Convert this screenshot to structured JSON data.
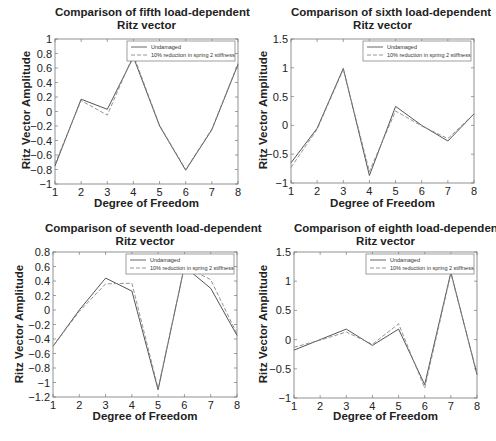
{
  "figure": {
    "legend": {
      "undamaged": "Undamaged",
      "damaged": "10% reduction in spring 2 stiffness"
    },
    "xlabel": "Degree of Freedom",
    "ylabel": "Ritz Vector Amplitude"
  },
  "colors": {
    "undamaged_line": "#555555",
    "damaged_line": "#888888",
    "axis": "#777777",
    "text": "#222222"
  },
  "chart_data": [
    {
      "type": "line",
      "title": "Comparison of fifth load-dependent Ritz vector",
      "title_lines": [
        "Comparison of fifth load-dependent",
        "Ritz vector"
      ],
      "xlabel": "Degree of Freedom",
      "ylabel": "Ritz Vector Amplitude",
      "x": [
        1,
        2,
        3,
        4,
        5,
        6,
        7,
        8
      ],
      "xlim": [
        1,
        8
      ],
      "ylim": [
        -1,
        1
      ],
      "yticks": [
        -1,
        -0.8,
        -0.6,
        -0.4,
        -0.2,
        0,
        0.2,
        0.4,
        0.6,
        0.8,
        1
      ],
      "ytick_labels": [
        "−1",
        "−0.8",
        "−0.6",
        "−0.4",
        "−0.2",
        "0",
        "0.2",
        "0.4",
        "0.6",
        "0.8",
        "1"
      ],
      "xticks": [
        "1",
        "2",
        "3",
        "4",
        "5",
        "6",
        "7",
        "8"
      ],
      "legend_position": "upper right",
      "grid": false,
      "series": [
        {
          "name": "Undamaged",
          "style": "solid",
          "values": [
            -0.75,
            0.17,
            0.03,
            0.75,
            -0.2,
            -0.81,
            -0.25,
            0.65
          ]
        },
        {
          "name": "10% reduction in spring 2 stiffness",
          "style": "dashed",
          "values": [
            -0.72,
            0.15,
            -0.05,
            0.78,
            -0.19,
            -0.8,
            -0.24,
            0.66
          ]
        }
      ]
    },
    {
      "type": "line",
      "title": "Comparison of sixth load-dependent Ritz vector",
      "title_lines": [
        "Comparison of sixth load-dependent",
        "Ritz vector"
      ],
      "xlabel": "Degree of Freedom",
      "ylabel": "Ritz Vector Amplitude",
      "x": [
        1,
        2,
        3,
        4,
        5,
        6,
        7,
        8
      ],
      "xlim": [
        1,
        8
      ],
      "ylim": [
        -1,
        1.5
      ],
      "yticks": [
        -1,
        -0.5,
        0,
        0.5,
        1,
        1.5
      ],
      "ytick_labels": [
        "−1",
        "−0.5",
        "0",
        "0.5",
        "1",
        "1.5"
      ],
      "xticks": [
        "1",
        "2",
        "3",
        "4",
        "5",
        "6",
        "7",
        "8"
      ],
      "legend_position": "upper right",
      "grid": false,
      "series": [
        {
          "name": "Undamaged",
          "style": "solid",
          "values": [
            -0.65,
            -0.05,
            0.99,
            -0.87,
            0.33,
            0.0,
            -0.27,
            0.2
          ]
        },
        {
          "name": "10% reduction in spring 2 stiffness",
          "style": "dashed",
          "values": [
            -0.73,
            -0.07,
            0.97,
            -0.8,
            0.25,
            -0.01,
            -0.23,
            0.2
          ]
        }
      ]
    },
    {
      "type": "line",
      "title": "Comparison of seventh load-dependent Ritz vector",
      "title_lines": [
        "Comparison of seventh load-dependent",
        "Ritz vector"
      ],
      "xlabel": "Degree of Freedom",
      "ylabel": "Ritz Vector Amplitude",
      "x": [
        1,
        2,
        3,
        4,
        5,
        6,
        7,
        8
      ],
      "xlim": [
        1,
        8
      ],
      "ylim": [
        -1.2,
        0.8
      ],
      "yticks": [
        -1.2,
        -1,
        -0.8,
        -0.6,
        -0.4,
        -0.2,
        0,
        0.2,
        0.4,
        0.6,
        0.8
      ],
      "ytick_labels": [
        "−1.2",
        "−1",
        "−0.8",
        "−0.6",
        "−0.4",
        "−0.2",
        "0",
        "0.2",
        "0.4",
        "0.6",
        "0.8"
      ],
      "xticks": [
        "1",
        "2",
        "3",
        "4",
        "5",
        "6",
        "7",
        "8"
      ],
      "legend_position": "upper right",
      "grid": false,
      "series": [
        {
          "name": "Undamaged",
          "style": "solid",
          "values": [
            -0.5,
            0.0,
            0.44,
            0.26,
            -1.1,
            0.6,
            0.3,
            -0.35
          ]
        },
        {
          "name": "10% reduction in spring 2 stiffness",
          "style": "dashed",
          "values": [
            -0.5,
            -0.02,
            0.36,
            0.37,
            -1.08,
            0.6,
            0.42,
            -0.33
          ]
        }
      ]
    },
    {
      "type": "line",
      "title": "Comparison of eighth load-dependent Ritz vector",
      "title_lines": [
        "Comparison of eighth load-dependent",
        "Ritz vector"
      ],
      "xlabel": "Degree of Freedom",
      "ylabel": "Ritz Vector Amplitude",
      "x": [
        1,
        2,
        3,
        4,
        5,
        6,
        7,
        8
      ],
      "xlim": [
        1,
        8
      ],
      "ylim": [
        -1,
        1.5
      ],
      "yticks": [
        -1,
        -0.5,
        0,
        0.5,
        1,
        1.5
      ],
      "ytick_labels": [
        "−1",
        "−0.5",
        "0",
        "0.5",
        "1",
        "1.5"
      ],
      "xticks": [
        "1",
        "2",
        "3",
        "4",
        "5",
        "6",
        "7",
        "8"
      ],
      "legend_position": "upper right",
      "grid": false,
      "series": [
        {
          "name": "Undamaged",
          "style": "solid",
          "values": [
            -0.18,
            0.0,
            0.18,
            -0.1,
            0.18,
            -0.77,
            1.15,
            -0.6
          ]
        },
        {
          "name": "10% reduction in spring 2 stiffness",
          "style": "dashed",
          "values": [
            -0.13,
            -0.01,
            0.13,
            -0.08,
            0.27,
            -0.83,
            1.13,
            -0.58
          ]
        }
      ]
    }
  ]
}
